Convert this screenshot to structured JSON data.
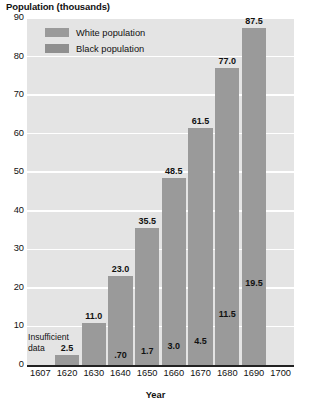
{
  "chart_data": {
    "type": "bar",
    "title": "Population (thousands)",
    "xlabel": "Year",
    "ylabel": "Population (thousands)",
    "ylim": [
      0,
      90
    ],
    "ytick_step": 10,
    "yticks": [
      "0",
      "10",
      "20",
      "30",
      "40",
      "50",
      "60",
      "70",
      "80",
      "90"
    ],
    "grid": true,
    "legend_position": "top-left",
    "categories": [
      "1607",
      "1620",
      "1630",
      "1640",
      "1650",
      "1660",
      "1670",
      "1680",
      "1690",
      "1700"
    ],
    "series": [
      {
        "name": "White population",
        "color": "#9a9a9a",
        "values": [
          null,
          2.5,
          11.0,
          23.0,
          35.5,
          48.5,
          61.5,
          77.0,
          87.5,
          null
        ],
        "labels": [
          "",
          "2.5",
          "11.0",
          "23.0",
          "35.5",
          "48.5",
          "61.5",
          "77.0",
          "87.5",
          ""
        ]
      },
      {
        "name": "Black population",
        "color": "#9a9a9a",
        "values": [
          null,
          null,
          null,
          0.7,
          1.7,
          3.0,
          4.5,
          11.5,
          19.5,
          null
        ],
        "labels": [
          "",
          "",
          "",
          ".70",
          "1.7",
          "3.0",
          "4.5",
          "11.5",
          "19.5",
          ""
        ]
      }
    ],
    "annotations": [
      {
        "text": "Insufficient data",
        "category": "1607"
      }
    ]
  },
  "legend": {
    "items": [
      {
        "label": "White population"
      },
      {
        "label": "Black population"
      }
    ]
  },
  "annotation": {
    "insufficient_line1": "Insufficient",
    "insufficient_line2": "data"
  }
}
